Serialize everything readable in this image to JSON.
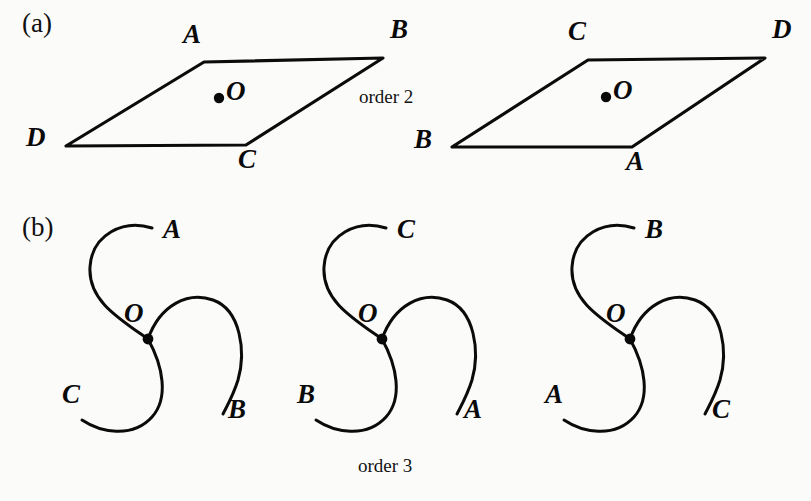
{
  "figure": {
    "parts": [
      {
        "key": "a",
        "label": "(a)",
        "order_caption": "order 2"
      },
      {
        "key": "b",
        "label": "(b)",
        "order_caption": "order 3"
      }
    ]
  },
  "part_a": {
    "label": "(a)",
    "order_caption": "order 2",
    "center_label": "O",
    "shapes": [
      {
        "name": "parallelogram-left",
        "vertex_labels": {
          "top_left": "A",
          "top_right": "B",
          "bottom_right": "C",
          "bottom_left": "D"
        },
        "points": {
          "top_left": [
            204,
            62
          ],
          "top_right": [
            383,
            58
          ],
          "bottom_right": [
            246,
            145
          ],
          "bottom_left": [
            66,
            146
          ]
        },
        "center_dot": [
          219,
          98
        ],
        "center_label": "O"
      },
      {
        "name": "parallelogram-right",
        "vertex_labels": {
          "top_left": "C",
          "top_right": "D",
          "bottom_right": "A",
          "bottom_left": "B"
        },
        "points": {
          "top_left": [
            588,
            60
          ],
          "top_right": [
            765,
            58
          ],
          "bottom_right": [
            632,
            147
          ],
          "bottom_left": [
            452,
            147
          ]
        },
        "center_dot": [
          606,
          97
        ],
        "center_label": "O"
      }
    ]
  },
  "part_b": {
    "label": "(b)",
    "order_caption": "order 3",
    "center_label": "O",
    "shapes": [
      {
        "name": "triskelion-1",
        "center": [
          148,
          339
        ],
        "arm_labels": {
          "upper": "A",
          "lower_right": "B",
          "lower_left": "C"
        },
        "label_positions": {
          "upper": [
            168,
            237
          ],
          "lower_right": [
            235,
            418
          ],
          "lower_left": [
            69,
            403
          ]
        }
      },
      {
        "name": "triskelion-2",
        "center": [
          382,
          339
        ],
        "arm_labels": {
          "upper": "C",
          "lower_right": "A",
          "lower_left": "B"
        },
        "label_positions": {
          "upper": [
            403,
            237
          ],
          "lower_right": [
            470,
            418
          ],
          "lower_left": [
            304,
            403
          ]
        }
      },
      {
        "name": "triskelion-3",
        "center": [
          630,
          339
        ],
        "arm_labels": {
          "upper": "B",
          "lower_right": "C",
          "lower_left": "A"
        },
        "label_positions": {
          "upper": [
            651,
            237
          ],
          "lower_right": [
            718,
            418
          ],
          "lower_left": [
            552,
            403
          ]
        }
      }
    ]
  },
  "colors": {
    "ink": "#0b0b0b",
    "paper": "#fbfbfa"
  }
}
